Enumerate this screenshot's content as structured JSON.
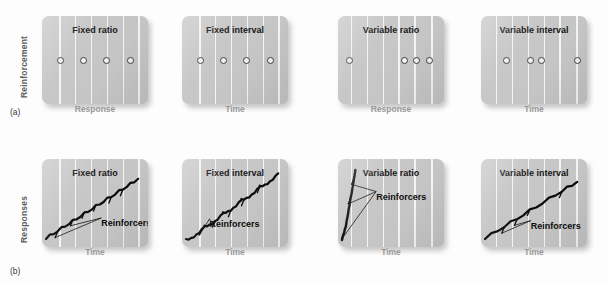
{
  "figure": {
    "rows": [
      {
        "tag": "(a)",
        "tag_x": 10,
        "tag_y": 107,
        "ylabel": "Reinforcement",
        "ylabel_x": 19,
        "ylabel_y": 98,
        "panel_y": 16,
        "panel_h": 88,
        "xlabel_y": 104,
        "panels": [
          {
            "title": "Fixed ratio",
            "xlabel": "Response",
            "x": 42,
            "w": 106,
            "gridlines": [
              16,
              31,
              46,
              61,
              76,
              91
            ],
            "dots": [
              14,
              36,
              58,
              80
            ],
            "dots_y": 47
          },
          {
            "title": "Fixed interval",
            "xlabel": "Time",
            "x": 182,
            "w": 106,
            "gridlines": [
              16,
              31,
              46,
              61,
              76,
              91
            ],
            "dots": [
              14,
              36,
              58,
              80
            ],
            "dots_y": 47
          },
          {
            "title": "Variable ratio",
            "xlabel": "Response",
            "x": 338,
            "w": 106,
            "gridlines": [
              12,
              27,
              42,
              57,
              72,
              88
            ],
            "dots": [
              8,
              59,
              71,
              83
            ],
            "dots_y": 47
          },
          {
            "title": "Variable interval",
            "xlabel": "Time",
            "x": 481,
            "w": 106,
            "gridlines": [
              14,
              29,
              44,
              59,
              74,
              90
            ],
            "dots": [
              21,
              43,
              54,
              88
            ],
            "dots_y": 47
          }
        ]
      },
      {
        "tag": "(b)",
        "tag_x": 10,
        "tag_y": 266,
        "ylabel": "Responses",
        "ylabel_x": 19,
        "ylabel_y": 243,
        "panel_y": 159,
        "panel_h": 88,
        "xlabel_y": 247,
        "panels": [
          {
            "title": "Fixed ratio",
            "xlabel": "Time",
            "x": 42,
            "w": 106,
            "gridlines": [
              16,
              31,
              46,
              61,
              76,
              91
            ],
            "annotation": "Reinforcers",
            "annot_x": 56,
            "annot_y": 67
          },
          {
            "title": "Fixed interval",
            "xlabel": "Time",
            "x": 182,
            "w": 106,
            "gridlines": [
              16,
              31,
              46,
              61,
              76,
              91
            ],
            "annotation": "Reinforcers",
            "annot_x": 26,
            "annot_y": 68
          },
          {
            "title": "Variable ratio",
            "xlabel": "Time",
            "x": 338,
            "w": 106,
            "gridlines": [
              12,
              27,
              42,
              57,
              72,
              88
            ],
            "annotation": "Reinforcers",
            "annot_x": 36,
            "annot_y": 37
          },
          {
            "title": "Variable interval",
            "xlabel": "Time",
            "x": 481,
            "w": 106,
            "gridlines": [
              14,
              29,
              44,
              59,
              74,
              90
            ],
            "annotation": "Reinforcers",
            "annot_x": 47,
            "annot_y": 70
          }
        ]
      }
    ]
  },
  "chart_data": {
    "type": "line",
    "panel_a": {
      "description": "Pattern of reinforcer delivery for four schedules of reinforcement",
      "ylabel": "Reinforcement",
      "schedules": [
        {
          "name": "Fixed ratio",
          "xlabel": "Response",
          "reinforcer_positions_pct": [
            13,
            34,
            55,
            76
          ]
        },
        {
          "name": "Fixed interval",
          "xlabel": "Time",
          "reinforcer_positions_pct": [
            13,
            34,
            55,
            76
          ]
        },
        {
          "name": "Variable ratio",
          "xlabel": "Response",
          "reinforcer_positions_pct": [
            8,
            56,
            67,
            78
          ]
        },
        {
          "name": "Variable interval",
          "xlabel": "Time",
          "reinforcer_positions_pct": [
            20,
            41,
            51,
            83
          ]
        }
      ]
    },
    "panel_b": {
      "description": "Cumulative response records for four schedules of reinforcement",
      "ylabel": "Responses",
      "xlabel": "Time",
      "annotation": "Reinforcers",
      "schedules": [
        {
          "name": "Fixed ratio",
          "pattern": "steady high rate with brief post-reinforcement pauses",
          "x": [
            0,
            12,
            24,
            36,
            48,
            60,
            72,
            84,
            96
          ],
          "y": [
            4,
            14,
            24,
            34,
            44,
            54,
            64,
            74,
            84
          ],
          "reinforcer_marks_pct": [
            14,
            28,
            42,
            56,
            70,
            84
          ]
        },
        {
          "name": "Fixed interval",
          "pattern": "scalloped: post-reinforcement pause then accelerating rate",
          "x": [
            0,
            10,
            22,
            34,
            46,
            58,
            70,
            82,
            96
          ],
          "y": [
            2,
            16,
            26,
            38,
            50,
            60,
            72,
            82,
            92
          ],
          "reinforcer_marks_pct": [
            16,
            32,
            48,
            64,
            80
          ]
        },
        {
          "name": "Variable ratio",
          "pattern": "very high steady rate, almost no pausing",
          "x": [
            0,
            4,
            8,
            12,
            14
          ],
          "y": [
            2,
            20,
            50,
            80,
            96
          ],
          "reinforcer_marks_pct": [
            10,
            55,
            80
          ]
        },
        {
          "name": "Variable interval",
          "pattern": "steady moderate rate, constant slope",
          "x": [
            0,
            20,
            40,
            60,
            80,
            96
          ],
          "y": [
            4,
            20,
            36,
            52,
            68,
            80
          ],
          "reinforcer_marks_pct": [
            18,
            34,
            46,
            78
          ]
        }
      ]
    }
  }
}
